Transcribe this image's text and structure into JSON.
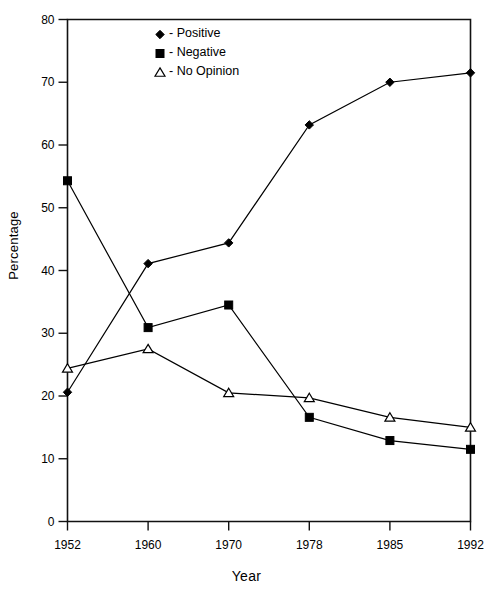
{
  "chart_data": {
    "type": "line",
    "title": "",
    "xlabel": "Year",
    "ylabel": "Percentage",
    "categories": [
      "1952",
      "1960",
      "1970",
      "1978",
      "1985",
      "1992"
    ],
    "ylim": [
      0,
      80
    ],
    "yticks": [
      0,
      10,
      20,
      30,
      40,
      50,
      60,
      70,
      80
    ],
    "ytick_labels": [
      "0",
      "10",
      "20",
      "30",
      "40",
      "50",
      "60",
      "70",
      "80"
    ],
    "grid": false,
    "legend_position": "top-center",
    "series": [
      {
        "name": "Positive",
        "marker": "diamond-filled",
        "color": "#000000",
        "values": [
          20.6,
          41.1,
          44.4,
          63.2,
          70.0,
          71.5
        ]
      },
      {
        "name": "Negative",
        "marker": "square-filled",
        "color": "#000000",
        "values": [
          54.3,
          30.9,
          34.5,
          16.6,
          12.9,
          11.5
        ]
      },
      {
        "name": "No Opinion",
        "marker": "triangle-open",
        "color": "#000000",
        "values": [
          24.4,
          27.5,
          20.5,
          19.7,
          16.6,
          15.0
        ]
      }
    ]
  },
  "legend": {
    "items": [
      {
        "label": "- Positive",
        "glyph": "diamond-filled"
      },
      {
        "label": "- Negative",
        "glyph": "square-filled"
      },
      {
        "label": "- No Opinion",
        "glyph": "triangle-open"
      }
    ]
  },
  "axis": {
    "x_title": "Year",
    "y_title": "Percentage"
  }
}
